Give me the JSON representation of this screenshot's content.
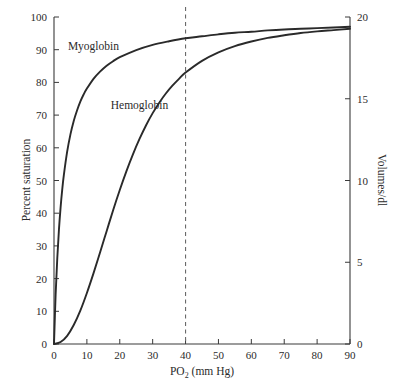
{
  "chart_data": {
    "type": "line",
    "title": "",
    "subtitle": "",
    "xlabel": "PO2 (mm Hg)",
    "xlabel_base": "PO",
    "xlabel_sub": "2",
    "xlabel_rest": " (mm Hg)",
    "ylabel": "Percent saturation",
    "ylabel_right": "Volumes/dl",
    "xlim": [
      0,
      90
    ],
    "ylim": [
      0,
      100
    ],
    "ylim_right": [
      0,
      20
    ],
    "grid": false,
    "legend_position": "inline-annotation",
    "xticks": [
      0,
      10,
      20,
      30,
      40,
      50,
      60,
      70,
      80,
      90
    ],
    "xtick_labels": [
      "0",
      "10",
      "20",
      "30",
      "40",
      "50",
      "60",
      "70",
      "80",
      "90"
    ],
    "yticks": [
      0,
      10,
      20,
      30,
      40,
      50,
      60,
      70,
      80,
      90,
      100
    ],
    "ytick_labels": [
      "0",
      "10",
      "20",
      "30",
      "40",
      "50",
      "60",
      "70",
      "80",
      "90",
      "100"
    ],
    "yticks_right": [
      0,
      5,
      10,
      15,
      20
    ],
    "ytick_labels_right": [
      "0",
      "5",
      "10",
      "15",
      "20"
    ],
    "annotations": [
      {
        "text": "Myoglobin",
        "x": 12,
        "y": 91,
        "name": "myoglobin-curve-label"
      },
      {
        "text": "Hemoglobin",
        "x": 26,
        "y": 73,
        "name": "hemoglobin-curve-label"
      }
    ],
    "reference_lines": [
      {
        "name": "po2-40-reference-line",
        "orientation": "vertical",
        "x": 40,
        "style": "dashed",
        "color": "#6a6a6a"
      }
    ],
    "series": [
      {
        "name": "Myoglobin",
        "color": "#2a2a2a",
        "model": "hyperbolic",
        "p50": 2.8,
        "x": [
          0,
          0.5,
          1,
          1.5,
          2,
          2.5,
          3,
          4,
          5,
          6,
          7,
          8,
          9,
          10,
          12,
          14,
          16,
          18,
          20,
          25,
          30,
          35,
          40,
          45,
          50,
          55,
          60,
          65,
          70,
          75,
          80,
          85,
          90
        ],
        "values": [
          0,
          15.2,
          26.3,
          34.9,
          41.7,
          47.2,
          51.7,
          58.8,
          64.1,
          68.2,
          71.4,
          74.1,
          76.3,
          78.1,
          81.1,
          83.3,
          85.1,
          86.5,
          87.7,
          89.9,
          91.5,
          92.6,
          93.5,
          94.1,
          94.7,
          95.2,
          95.5,
          95.9,
          96.2,
          96.4,
          96.6,
          96.8,
          97.0
        ]
      },
      {
        "name": "Hemoglobin",
        "color": "#2a2a2a",
        "model": "hill",
        "p50": 26,
        "hill_n": 2.8,
        "x": [
          0,
          2,
          4,
          6,
          8,
          10,
          12,
          14,
          16,
          18,
          20,
          22,
          24,
          26,
          28,
          30,
          32,
          34,
          36,
          38,
          40,
          45,
          50,
          55,
          60,
          65,
          70,
          75,
          80,
          85,
          90
        ],
        "values": [
          0,
          0.6,
          2.5,
          5.8,
          10.2,
          15.6,
          21.6,
          28.0,
          34.5,
          41.0,
          47.1,
          52.8,
          58.0,
          62.7,
          66.9,
          70.6,
          73.8,
          76.6,
          79.0,
          81.1,
          83.0,
          86.6,
          89.2,
          91.1,
          92.5,
          93.6,
          94.4,
          95.1,
          95.6,
          96.0,
          96.4
        ]
      }
    ],
    "key_readings": [
      {
        "label": "Hemoglobin saturation at PO2 = 40 mm Hg",
        "x": 40,
        "y": 83
      },
      {
        "label": "Hemoglobin saturation at PO2 = 90 mm Hg",
        "x": 90,
        "y": 96.4
      },
      {
        "label": "Myoglobin saturation at PO2 = 40 mm Hg",
        "x": 40,
        "y": 93.5
      }
    ]
  }
}
